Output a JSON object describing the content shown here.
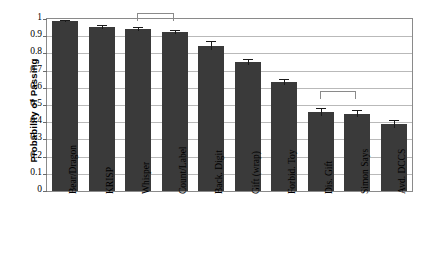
{
  "chart_data": {
    "type": "bar",
    "title": "",
    "xlabel": "",
    "ylabel": "Probability of Passing",
    "ylim": [
      0,
      1
    ],
    "ytick_labels": [
      "1",
      "0.9",
      "0.8",
      "0.7",
      "0.6",
      "0.5",
      "0.4",
      "0.3",
      "0.2",
      "0.1",
      "0"
    ],
    "ytick_values": [
      1,
      0.9,
      0.8,
      0.7,
      0.6,
      0.5,
      0.4,
      0.3,
      0.2,
      0.1,
      0
    ],
    "grid": true,
    "legend": "none",
    "categories": [
      "Bear/Dragon",
      "KRISP",
      "Whisper",
      "Count/Label",
      "Back. Digit",
      "Gift (wrap)",
      "Forbid. Toy",
      "Dis. Gift",
      "Simon Says",
      "Avd. DCCS"
    ],
    "values": [
      0.99,
      0.955,
      0.94,
      0.925,
      0.845,
      0.75,
      0.635,
      0.46,
      0.45,
      0.39
    ],
    "errors": [
      0.005,
      0.012,
      0.012,
      0.012,
      0.025,
      0.018,
      0.018,
      0.022,
      0.022,
      0.025
    ],
    "bar_color": "#3a3a3a",
    "annotations": [
      {
        "type": "significance-bracket",
        "from": "Whisper",
        "to": "Count/Label",
        "y": 1.03
      },
      {
        "type": "significance-bracket",
        "from": "Dis. Gift",
        "to": "Simon Says",
        "y": 0.575
      }
    ]
  }
}
